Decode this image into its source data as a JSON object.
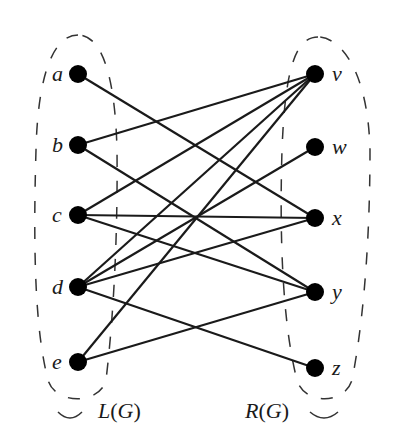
{
  "diagram": {
    "type": "bipartite-graph",
    "left_set": {
      "label_prefix": "L",
      "label_arg": "G",
      "label": "L(G)",
      "nodes": [
        {
          "id": "a",
          "label": "a",
          "x": 78,
          "y": 74
        },
        {
          "id": "b",
          "label": "b",
          "x": 78,
          "y": 145
        },
        {
          "id": "c",
          "label": "c",
          "x": 78,
          "y": 215
        },
        {
          "id": "d",
          "label": "d",
          "x": 78,
          "y": 287
        },
        {
          "id": "e",
          "label": "e",
          "x": 78,
          "y": 362
        }
      ]
    },
    "right_set": {
      "label_prefix": "R",
      "label_arg": "G",
      "label": "R(G)",
      "nodes": [
        {
          "id": "v",
          "label": "v",
          "x": 315,
          "y": 74
        },
        {
          "id": "w",
          "label": "w",
          "x": 315,
          "y": 147
        },
        {
          "id": "x",
          "label": "x",
          "x": 315,
          "y": 218
        },
        {
          "id": "y",
          "label": "y",
          "x": 315,
          "y": 292
        },
        {
          "id": "z",
          "label": "z",
          "x": 315,
          "y": 368
        }
      ]
    },
    "edges": [
      [
        "a",
        "x"
      ],
      [
        "b",
        "v"
      ],
      [
        "b",
        "y"
      ],
      [
        "c",
        "v"
      ],
      [
        "c",
        "x"
      ],
      [
        "c",
        "y"
      ],
      [
        "d",
        "v"
      ],
      [
        "d",
        "w"
      ],
      [
        "d",
        "x"
      ],
      [
        "d",
        "z"
      ],
      [
        "e",
        "v"
      ],
      [
        "e",
        "y"
      ]
    ],
    "colors": {
      "node": "#000000",
      "edge": "#1a1a1a",
      "boundary": "#333333"
    }
  }
}
